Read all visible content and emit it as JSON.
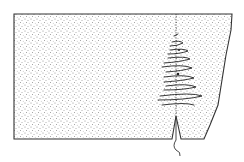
{
  "diagram": {
    "type": "sewing-illustration",
    "colors": {
      "background": "#ffffff",
      "outline": "#333333",
      "stipple": "#8a8a8a",
      "stitch": "#222222"
    },
    "elements": [
      {
        "name": "fabric-panel",
        "description": "rectangular stippled fabric piece with tapered right edge"
      },
      {
        "name": "seam-line",
        "description": "vertical dotted seam line"
      },
      {
        "name": "stitches",
        "description": "zigzag overcast stitches along the seam"
      },
      {
        "name": "notch",
        "description": "V-shaped slit at bottom of seam"
      },
      {
        "name": "thread-tail",
        "description": "wavy loose thread hanging from the notch"
      }
    ]
  }
}
